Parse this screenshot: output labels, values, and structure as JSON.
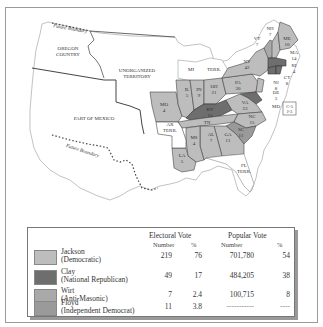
{
  "map": {
    "title": "Election of 1832",
    "colors": {
      "jackson": "#bdbdbd",
      "clay": "#6e6e6e",
      "wirt": "#a9a9a9",
      "floyd": "#9a9a9a",
      "unassigned": "#ffffff",
      "border": "#444444"
    },
    "regions": {
      "oregon": "OREGON\nCOUNTRY",
      "oregon_l1": "OREGON",
      "oregon_l2": "COUNTRY",
      "unorg_l1": "UNORGANIZED",
      "unorg_l2": "TERRITORY",
      "mexico": "PART OF MEXICO",
      "future_boundary_north": "Future Boundary",
      "future_boundary_south": "Future Boundary",
      "mi": "MI",
      "mi_terr": "TERR.",
      "ar_l1": "AR",
      "ar_l2": "TERR.",
      "fl_l1": "FL",
      "fl_l2": "TERR."
    },
    "states": [
      {
        "abbr": "ME",
        "votes": "10",
        "party": "jackson"
      },
      {
        "abbr": "NH",
        "votes": "7",
        "party": "jackson"
      },
      {
        "abbr": "VT",
        "votes": "7",
        "party": "wirt"
      },
      {
        "abbr": "MA",
        "votes": "14",
        "party": "clay"
      },
      {
        "abbr": "RI",
        "votes": "4",
        "party": "clay"
      },
      {
        "abbr": "CT",
        "votes": "8",
        "party": "clay"
      },
      {
        "abbr": "NY",
        "votes": "42",
        "party": "jackson"
      },
      {
        "abbr": "NJ",
        "votes": "8",
        "party": "jackson"
      },
      {
        "abbr": "DE",
        "votes": "3",
        "party": "clay"
      },
      {
        "abbr": "MD",
        "votes": "C-5 J-3",
        "party": "split"
      },
      {
        "abbr": "PA",
        "votes": "30",
        "party": "jackson"
      },
      {
        "abbr": "OH",
        "votes": "21",
        "party": "jackson"
      },
      {
        "abbr": "IN",
        "votes": "9",
        "party": "jackson"
      },
      {
        "abbr": "IL",
        "votes": "5",
        "party": "jackson"
      },
      {
        "abbr": "MO",
        "votes": "4",
        "party": "jackson"
      },
      {
        "abbr": "KY",
        "votes": "15",
        "party": "clay"
      },
      {
        "abbr": "VA",
        "votes": "23",
        "party": "jackson"
      },
      {
        "abbr": "NC",
        "votes": "15",
        "party": "jackson"
      },
      {
        "abbr": "SC",
        "votes": "11",
        "party": "floyd"
      },
      {
        "abbr": "TN",
        "votes": "15",
        "party": "jackson"
      },
      {
        "abbr": "GA",
        "votes": "11",
        "party": "jackson"
      },
      {
        "abbr": "AL",
        "votes": "7",
        "party": "jackson"
      },
      {
        "abbr": "MS",
        "votes": "4",
        "party": "jackson"
      },
      {
        "abbr": "LA",
        "votes": "5",
        "party": "jackson"
      }
    ],
    "md_box_l1": "C-5",
    "md_box_l2": "J-3"
  },
  "legend": {
    "electoral_header": "Electoral Vote",
    "popular_header": "Popular Vote",
    "col_number": "Number",
    "col_percent": "%",
    "rows": [
      {
        "name": "Jackson",
        "party": "(Democratic)",
        "ev_num": "219",
        "ev_pct": "76",
        "pv_num": "701,780",
        "pv_pct": "54",
        "color": "#bdbdbd"
      },
      {
        "name": "Clay",
        "party": "(National Republican)",
        "ev_num": "49",
        "ev_pct": "17",
        "pv_num": "484,205",
        "pv_pct": "38",
        "color": "#6e6e6e"
      },
      {
        "name": "Wirt",
        "party": "(Anti-Masonic)",
        "ev_num": "7",
        "ev_pct": "2.4",
        "pv_num": "100,715",
        "pv_pct": "8",
        "color": "#a9a9a9"
      },
      {
        "name": "Floyd",
        "party": "(Independent Democrat)",
        "ev_num": "11",
        "ev_pct": "3.8",
        "pv_num": "-----------",
        "pv_pct": "----",
        "color": "#9a9a9a"
      }
    ]
  }
}
